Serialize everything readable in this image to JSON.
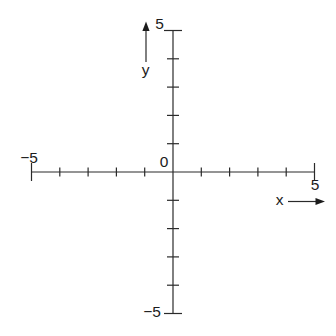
{
  "page": {
    "background": "#ffffff"
  },
  "chart_data": {
    "type": "scatter",
    "title": "",
    "xlabel": "x",
    "ylabel": "y",
    "xlim": [
      -5,
      5
    ],
    "ylim": [
      -5,
      5
    ],
    "tick_step": 1,
    "x_tick_values": [
      -5,
      -4,
      -3,
      -2,
      -1,
      1,
      2,
      3,
      4,
      5
    ],
    "y_tick_values": [
      -5,
      -4,
      -3,
      -2,
      -1,
      1,
      2,
      3,
      4,
      5
    ],
    "series": [],
    "grid": false,
    "axis_color": "#2a2a2a"
  },
  "labels": {
    "x_axis": "x",
    "y_axis": "y",
    "origin": "0",
    "x_min": "−5",
    "x_max": "5",
    "y_min": "−5",
    "y_max": "5"
  }
}
